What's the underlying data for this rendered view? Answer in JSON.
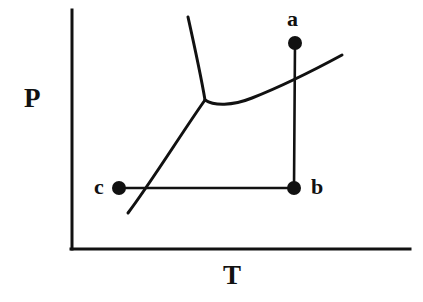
{
  "figure": {
    "kind": "phase-diagram",
    "background_color": "#ffffff",
    "line_color": "#111111"
  },
  "axes": {
    "y_label": "P",
    "x_label": "T",
    "origin": {
      "x": 72,
      "y": 249
    },
    "y_axis_top": {
      "x": 72,
      "y": 10
    },
    "x_axis_right": {
      "x": 410,
      "y": 249
    },
    "axis_width": 3
  },
  "points": [
    {
      "id": "a",
      "label": "a",
      "x": 295,
      "y": 43,
      "radius": 7
    },
    {
      "id": "b",
      "label": "b",
      "x": 294,
      "y": 188,
      "radius": 7
    },
    {
      "id": "c",
      "label": "c",
      "x": 119,
      "y": 188,
      "radius": 7
    }
  ],
  "process_paths": [
    {
      "id": "a-to-b",
      "from": "a",
      "to": "b",
      "d": "M 295 43 L 294 188"
    },
    {
      "id": "c-to-b",
      "from": "c",
      "to": "b",
      "d": "M 119 188 L 294 188"
    }
  ],
  "phase_boundaries": [
    {
      "id": "fusion-curve",
      "name": "solid-liquid boundary",
      "d": "M 205 100 C 201 76, 194 44, 188 17"
    },
    {
      "id": "sublimation-curve",
      "name": "solid-vapor boundary",
      "d": "M 205 100 C 185 128, 150 184, 128 213"
    },
    {
      "id": "vaporization-curve",
      "name": "liquid-vapor boundary",
      "d": "M 205 100 C 214 106, 232 106, 252 98 C 285 85, 318 68, 342 55"
    }
  ],
  "triple_point": {
    "x": 205,
    "y": 100
  },
  "chart_data": {
    "type": "line",
    "title": "",
    "xlabel": "T",
    "ylabel": "P",
    "grid": false,
    "legend": null,
    "series": [
      {
        "name": "fusion-curve",
        "points": [
          [
            205,
            100
          ],
          [
            198,
            65
          ],
          [
            188,
            17
          ]
        ]
      },
      {
        "name": "sublimation-curve",
        "points": [
          [
            205,
            100
          ],
          [
            170,
            152
          ],
          [
            128,
            213
          ]
        ]
      },
      {
        "name": "vaporization-curve",
        "points": [
          [
            205,
            100
          ],
          [
            225,
            103
          ],
          [
            252,
            98
          ],
          [
            295,
            77
          ],
          [
            342,
            55
          ]
        ]
      },
      {
        "name": "process-a-b",
        "points": [
          [
            295,
            43
          ],
          [
            294,
            188
          ]
        ]
      },
      {
        "name": "process-c-b",
        "points": [
          [
            119,
            188
          ],
          [
            294,
            188
          ]
        ]
      }
    ],
    "annotations": [
      {
        "text": "a",
        "x": 295,
        "y": 43
      },
      {
        "text": "b",
        "x": 294,
        "y": 188
      },
      {
        "text": "c",
        "x": 119,
        "y": 188
      }
    ]
  }
}
